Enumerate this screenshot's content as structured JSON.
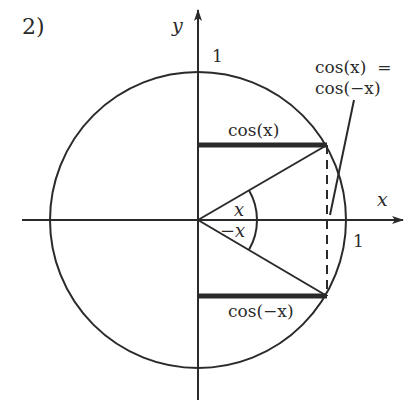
{
  "figure": {
    "number_label": "2)",
    "axes": {
      "x_label": "x",
      "y_label": "y",
      "x_tick_label": "1",
      "y_tick_label": "1"
    },
    "unit_circle": {
      "center": [
        198,
        220
      ],
      "radius": 148
    },
    "angles": {
      "upper_label": "x",
      "lower_label": "−x"
    },
    "segments": {
      "upper_label": "cos(x)",
      "lower_label": "cos(−x)"
    },
    "annotation": {
      "line1": "cos(x)  =",
      "line2": "cos(−x)"
    },
    "colors": {
      "ink": "#2a2a2a",
      "background": "#ffffff"
    }
  }
}
